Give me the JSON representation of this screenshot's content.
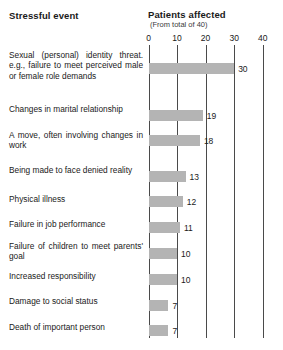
{
  "header": {
    "left_title": "Stressful event",
    "right_title": "Patients affected",
    "right_subtitle": "(From total of 40)"
  },
  "chart_data": {
    "type": "bar",
    "orientation": "horizontal",
    "title": "Patients affected",
    "subtitle": "(From total of 40)",
    "xlabel": "",
    "ylabel": "Stressful event",
    "xlim": [
      0,
      40
    ],
    "xticks": [
      0,
      10,
      20,
      30,
      40
    ],
    "xtick_labels": [
      "0",
      "10",
      "20",
      "30",
      "40"
    ],
    "grid": true,
    "legend": false,
    "bar_color": "#b4b4b4",
    "total": 40,
    "categories": [
      "Sexual (personal) identity threat. e.g., failure to meet perceived male or female role demands",
      "Changes in marital relationship",
      "A move, often involving changes in work",
      "Being made to face denied reality",
      "Physical illness",
      "Failure in job performance",
      "Failure of children to meet parents' goal",
      "Increased responsibility",
      "Damage to social status",
      "Death of important person"
    ],
    "values": [
      30,
      19,
      18,
      13,
      12,
      11,
      10,
      10,
      7,
      7
    ],
    "value_labels": [
      "30",
      "19",
      "18",
      "13",
      "12",
      "11",
      "10",
      "10",
      "7",
      "7"
    ]
  },
  "rows": [
    {
      "label": "Sexual (personal) identity threat. e.g., failure to meet perceived male or female role demands",
      "value": 30,
      "value_label": "30"
    },
    {
      "label": "Changes in marital relationship",
      "value": 19,
      "value_label": "19"
    },
    {
      "label": "A move, often involving changes in work",
      "value": 18,
      "value_label": "18"
    },
    {
      "label": "Being made to face denied reality",
      "value": 13,
      "value_label": "13"
    },
    {
      "label": "Physical illness",
      "value": 12,
      "value_label": "12"
    },
    {
      "label": "Failure in job performance",
      "value": 11,
      "value_label": "11"
    },
    {
      "label": "Failure of children to meet parents' goal",
      "value": 10,
      "value_label": "10"
    },
    {
      "label": "Increased responsibility",
      "value": 10,
      "value_label": "10"
    },
    {
      "label": "Damage to social status",
      "value": 7,
      "value_label": "7"
    },
    {
      "label": "Death of important person",
      "value": 7,
      "value_label": "7"
    }
  ],
  "axis": {
    "ticks": [
      "0",
      "10",
      "20",
      "30",
      "40"
    ]
  }
}
